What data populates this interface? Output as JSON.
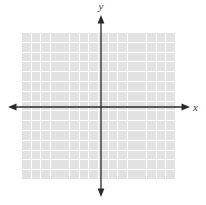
{
  "figure": {
    "type": "cartesian-coordinate-plane",
    "x_axis_label": "x",
    "y_axis_label": "y",
    "grid": {
      "columns": 16,
      "rows": 15,
      "cell_color": "#e2e2e3",
      "gridline_color": "#ffffff"
    },
    "axis_color": "#2b2b2b",
    "label_color": "#3f3f3f",
    "background_color": "#ffffff"
  }
}
